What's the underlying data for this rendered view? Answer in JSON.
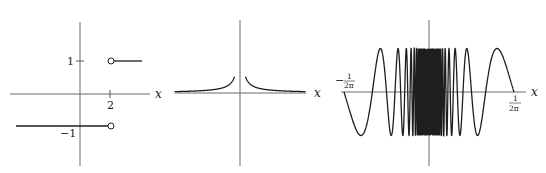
{
  "chart_data": [
    {
      "type": "line",
      "title": "",
      "description": "Piecewise step function: y = -1 for x < 2, y = 1 for x > 2, open circles at x = 2",
      "xlabel": "x",
      "ylabel": "",
      "x_ticks": [
        {
          "value": 2,
          "label": "2"
        }
      ],
      "y_ticks": [
        {
          "value": 1,
          "label": "1"
        },
        {
          "value": -1,
          "label": "−1"
        }
      ],
      "series": [
        {
          "name": "lower",
          "x": [
            -2.2,
            2
          ],
          "y": [
            -1,
            -1
          ],
          "end_marker": "open-circle"
        },
        {
          "name": "upper",
          "x": [
            2,
            3.1
          ],
          "y": [
            1,
            1
          ],
          "start_marker": "open-circle"
        }
      ],
      "grid": false
    },
    {
      "type": "line",
      "title": "",
      "description": "Curve with vertical asymptote at x = 0, y → ∞ as x → 0 (like 1/|x|), approaching 0 as |x| grows",
      "xlabel": "x",
      "ylabel": "",
      "x_ticks": [],
      "y_ticks": [],
      "series": [
        {
          "name": "f",
          "formula": "1/|x|",
          "x_range": [
            -6,
            6
          ]
        }
      ],
      "grid": false
    },
    {
      "type": "line",
      "title": "",
      "description": "y = sin(1/x) oscillating rapidly near x = 0 on [-1/(2π), 1/(2π)]",
      "xlabel": "x",
      "ylabel": "",
      "x_ticks": [
        {
          "value": -0.159155,
          "label_num": "1",
          "label_den": "2π",
          "sign": "−"
        },
        {
          "value": 0.159155,
          "label_num": "1",
          "label_den": "2π",
          "sign": ""
        }
      ],
      "y_ticks": [],
      "series": [
        {
          "name": "f",
          "formula": "sin(1/x)",
          "x_range": [
            -0.159155,
            0.159155
          ]
        }
      ],
      "ylim": [
        -1,
        1
      ],
      "grid": false
    }
  ],
  "labels": {
    "x": "x",
    "one": "1",
    "minus_one": "−1",
    "two": "2",
    "neg_sign": "−",
    "frac_num": "1",
    "frac_den": "2π"
  }
}
